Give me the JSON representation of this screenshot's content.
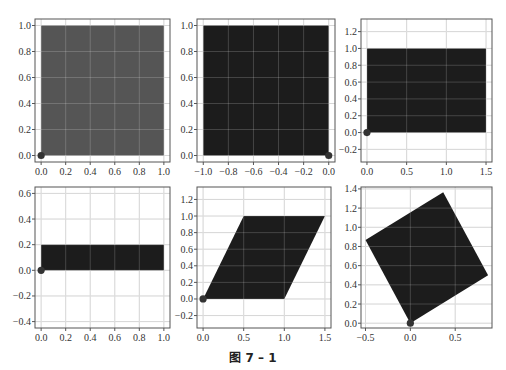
{
  "caption": "图 7 – 1",
  "colors": {
    "shape_light": "#555555",
    "shape_dark": "#1c1c1c",
    "grid": "#cfcfcf",
    "frame": "#555555",
    "origin_dot": "#333333"
  },
  "chart_data": [
    {
      "type": "area",
      "title": "Unit square",
      "xlim": [
        -0.05,
        1.05
      ],
      "ylim": [
        -0.05,
        1.05
      ],
      "grid": true,
      "xticks": [
        "0.0",
        "0.2",
        "0.4",
        "0.6",
        "0.8",
        "1.0"
      ],
      "yticks": [
        "0.0",
        "0.2",
        "0.4",
        "0.6",
        "0.8",
        "1.0"
      ],
      "polygon": [
        [
          0,
          0
        ],
        [
          1,
          0
        ],
        [
          1,
          1
        ],
        [
          0,
          1
        ]
      ],
      "origin_marker": [
        0,
        0
      ],
      "fill": "light"
    },
    {
      "type": "area",
      "title": "Reflection across y-axis",
      "xlim": [
        -1.05,
        0.05
      ],
      "ylim": [
        -0.05,
        1.05
      ],
      "grid": true,
      "xticks": [
        "−1.0",
        "−0.8",
        "−0.6",
        "−0.4",
        "−0.2",
        "0.0"
      ],
      "yticks": [
        "0.0",
        "0.2",
        "0.4",
        "0.6",
        "0.8",
        "1.0"
      ],
      "polygon": [
        [
          0,
          0
        ],
        [
          -1,
          0
        ],
        [
          -1,
          1
        ],
        [
          0,
          1
        ]
      ],
      "origin_marker": [
        0,
        0
      ],
      "fill": "dark"
    },
    {
      "type": "area",
      "title": "Horizontal stretch x1.5",
      "xlim": [
        -0.075,
        1.575
      ],
      "ylim": [
        -0.35,
        1.35
      ],
      "grid": true,
      "xticks": [
        "0.0",
        "0.5",
        "1.0",
        "1.5"
      ],
      "yticks": [
        "−0.2",
        "0.0",
        "0.2",
        "0.4",
        "0.6",
        "0.8",
        "1.0",
        "1.2"
      ],
      "polygon": [
        [
          0,
          0
        ],
        [
          1.5,
          0
        ],
        [
          1.5,
          1
        ],
        [
          0,
          1
        ]
      ],
      "origin_marker": [
        0,
        0
      ],
      "fill": "dark"
    },
    {
      "type": "area",
      "title": "Vertical compression x0.2",
      "xlim": [
        -0.05,
        1.05
      ],
      "ylim": [
        -0.45,
        0.65
      ],
      "grid": true,
      "xticks": [
        "0.0",
        "0.2",
        "0.4",
        "0.6",
        "0.8",
        "1.0"
      ],
      "yticks": [
        "−0.4",
        "−0.2",
        "0.0",
        "0.2",
        "0.4",
        "0.6"
      ],
      "polygon": [
        [
          0,
          0
        ],
        [
          1,
          0
        ],
        [
          1,
          0.2
        ],
        [
          0,
          0.2
        ]
      ],
      "origin_marker": [
        0,
        0
      ],
      "fill": "dark"
    },
    {
      "type": "area",
      "title": "Shear",
      "xlim": [
        -0.075,
        1.575
      ],
      "ylim": [
        -0.35,
        1.35
      ],
      "grid": true,
      "xticks": [
        "0.0",
        "0.5",
        "1.0",
        "1.5"
      ],
      "yticks": [
        "−0.2",
        "0.0",
        "0.2",
        "0.4",
        "0.6",
        "0.8",
        "1.0",
        "1.2"
      ],
      "polygon": [
        [
          0,
          0
        ],
        [
          1,
          0
        ],
        [
          1.5,
          1
        ],
        [
          0.5,
          1
        ]
      ],
      "origin_marker": [
        0,
        0
      ],
      "fill": "dark"
    },
    {
      "type": "area",
      "title": "Rotation 30°",
      "xlim": [
        -0.55,
        0.91
      ],
      "ylim": [
        -0.05,
        1.42
      ],
      "grid": true,
      "xticks": [
        "−0.5",
        "0.0",
        "0.5"
      ],
      "yticks": [
        "0.0",
        "0.2",
        "0.4",
        "0.6",
        "0.8",
        "1.0",
        "1.2",
        "1.4"
      ],
      "polygon": [
        [
          0,
          0
        ],
        [
          0.866,
          0.5
        ],
        [
          0.366,
          1.366
        ],
        [
          -0.5,
          0.866
        ]
      ],
      "origin_marker": [
        0,
        0
      ],
      "fill": "dark"
    }
  ],
  "panels_px": [
    {
      "left": 35,
      "top": 19,
      "right": 170,
      "bottom": 162
    },
    {
      "left": 197,
      "top": 19,
      "right": 335,
      "bottom": 162
    },
    {
      "left": 361,
      "top": 19,
      "right": 492,
      "bottom": 162
    },
    {
      "left": 35,
      "top": 187,
      "right": 170,
      "bottom": 328
    },
    {
      "left": 197,
      "top": 187,
      "right": 331,
      "bottom": 328
    },
    {
      "left": 361,
      "top": 187,
      "right": 492,
      "bottom": 328
    }
  ]
}
